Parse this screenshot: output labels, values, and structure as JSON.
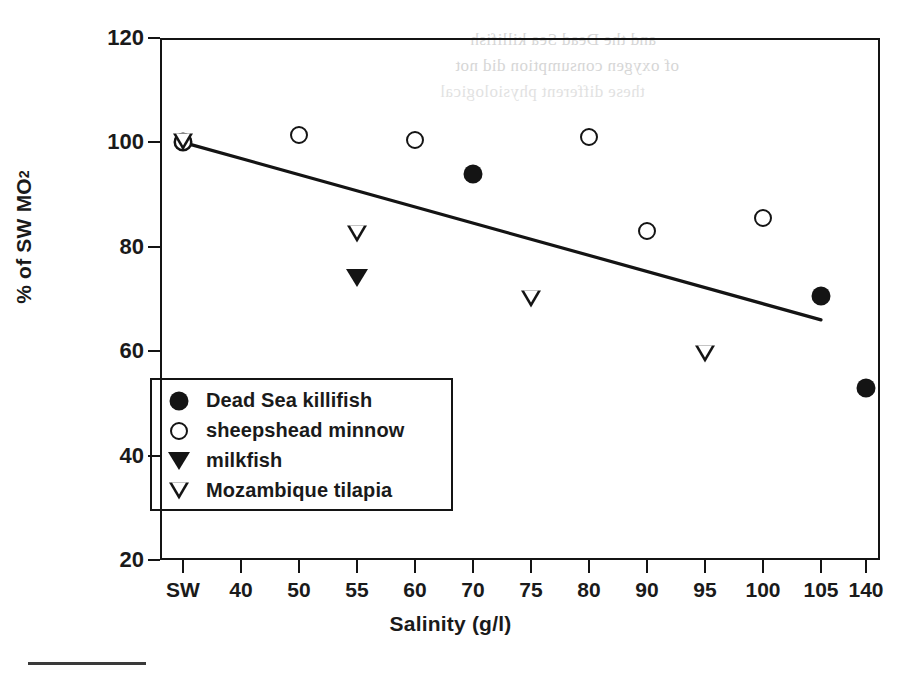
{
  "chart_data": {
    "type": "scatter",
    "title": "",
    "xlabel": "Salinity (g/l)",
    "ylabel": "% of SW MO2",
    "ylabel_main": "% of SW MO",
    "ylabel_sub": "2",
    "categories": [
      "SW",
      "40",
      "50",
      "55",
      "60",
      "70",
      "75",
      "80",
      "90",
      "95",
      "100",
      "105",
      "140"
    ],
    "ylim": [
      20,
      120
    ],
    "yticks": [
      20,
      40,
      60,
      80,
      100,
      120
    ],
    "grid": false,
    "legend_position": "lower-left-inside",
    "series": [
      {
        "name": "Dead Sea killifish",
        "marker": "filled-circle",
        "color": "#141414",
        "points": [
          {
            "x": "SW",
            "y": 100
          },
          {
            "x": "70",
            "y": 94
          },
          {
            "x": "105",
            "y": 70.5
          },
          {
            "x": "140",
            "y": 53
          }
        ]
      },
      {
        "name": "sheepshead minnow",
        "marker": "open-circle",
        "color": "#141414",
        "points": [
          {
            "x": "SW",
            "y": 100
          },
          {
            "x": "50",
            "y": 101.5
          },
          {
            "x": "60",
            "y": 100.5
          },
          {
            "x": "80",
            "y": 101
          },
          {
            "x": "90",
            "y": 83
          },
          {
            "x": "100",
            "y": 85.5
          }
        ]
      },
      {
        "name": "milkfish",
        "marker": "filled-triangle-down",
        "color": "#141414",
        "points": [
          {
            "x": "55",
            "y": 74
          }
        ]
      },
      {
        "name": "Mozambique tilapia",
        "marker": "open-triangle-down",
        "color": "#141414",
        "points": [
          {
            "x": "SW",
            "y": 100
          },
          {
            "x": "55",
            "y": 82.5
          },
          {
            "x": "75",
            "y": 70
          },
          {
            "x": "95",
            "y": 59.5
          }
        ]
      }
    ],
    "trendline": {
      "name": "regression line",
      "from": {
        "x": "SW",
        "y": 100
      },
      "to": {
        "x": "105",
        "y": 66
      }
    }
  },
  "legend": {
    "entries": [
      {
        "label": "Dead Sea killifish",
        "marker": "filled-circle"
      },
      {
        "label": "sheepshead minnow",
        "marker": "open-circle"
      },
      {
        "label": "milkfish",
        "marker": "filled-triangle-down"
      },
      {
        "label": "Mozambique tilapia",
        "marker": "open-triangle-down"
      }
    ]
  },
  "axes": {
    "y_title_main": "% of SW MO",
    "y_title_sub": "2",
    "x_title": "Salinity (g/l)",
    "y_tick_labels": [
      "120",
      "100",
      "80",
      "60",
      "40",
      "20"
    ],
    "x_tick_labels": [
      "SW",
      "40",
      "50",
      "55",
      "60",
      "70",
      "75",
      "80",
      "90",
      "95",
      "100",
      "105",
      "140"
    ]
  },
  "scan_artifacts": {
    "ghost_lines": [
      "and the Dead Sea killifish",
      "of oxygen consumption did not",
      "these different physiological"
    ]
  }
}
